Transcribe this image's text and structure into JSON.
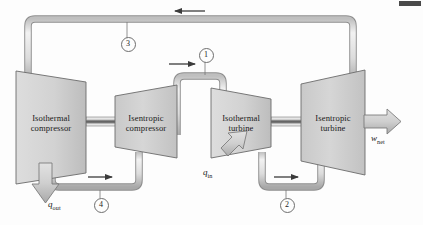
{
  "figure": {
    "background": "#fdfdfd"
  },
  "components": [
    {
      "id": "isothermal-compressor",
      "line1": "Isothermal",
      "line2": "compressor",
      "type": "compressor"
    },
    {
      "id": "isentropic-compressor",
      "line1": "Isentropic",
      "line2": "compressor",
      "type": "compressor"
    },
    {
      "id": "isothermal-turbine",
      "line1": "Isothermal",
      "line2": "turbine",
      "type": "turbine"
    },
    {
      "id": "isentropic-turbine",
      "line1": "Isentropic",
      "line2": "turbine",
      "type": "turbine"
    }
  ],
  "state_points": [
    {
      "id": "state-1",
      "label": "1"
    },
    {
      "id": "state-2",
      "label": "2"
    },
    {
      "id": "state-3",
      "label": "3"
    },
    {
      "id": "state-4",
      "label": "4"
    }
  ],
  "energy_flows": [
    {
      "id": "heat-out",
      "symbol": "q",
      "subscript": "out",
      "direction": "down"
    },
    {
      "id": "heat-in",
      "symbol": "q",
      "subscript": "in",
      "direction": "up-right"
    },
    {
      "id": "work-net",
      "symbol": "w",
      "subscript": "net",
      "direction": "right"
    }
  ],
  "flow_arrows": [
    {
      "id": "arrow-top-return",
      "direction": "left"
    },
    {
      "id": "arrow-state-1",
      "direction": "right"
    },
    {
      "id": "arrow-state-4",
      "direction": "right"
    },
    {
      "id": "arrow-state-2",
      "direction": "right"
    }
  ],
  "colors": {
    "body_fill_light": "#d9d9d9",
    "body_fill_dark": "#b4b4b4",
    "outline": "#6b6b6b",
    "pipe_fill": "#e8e8e8",
    "pipe_edge": "#8d8d8d",
    "shaft_dark": "#707070",
    "arrow_fill": "#c4c4c4",
    "text": "#1a1a1a"
  }
}
